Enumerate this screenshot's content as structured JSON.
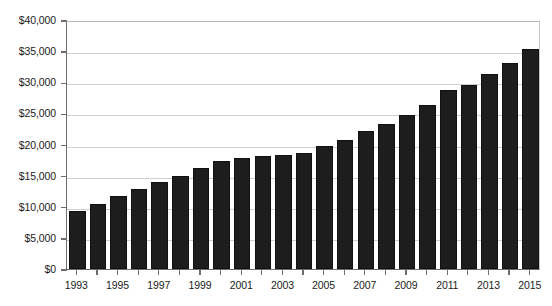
{
  "chart_data": {
    "type": "bar",
    "title": "",
    "subtitle": "",
    "xlabel": "",
    "ylabel": "",
    "grid": true,
    "legend": null,
    "legend_position": "none",
    "ylim": [
      0,
      40000
    ],
    "ytick_values": [
      0,
      5000,
      10000,
      15000,
      20000,
      25000,
      30000,
      35000,
      40000
    ],
    "ytick_labels": [
      "$0",
      "$5,000",
      "$10,000",
      "$15,000",
      "$20,000",
      "$25,000",
      "$30,000",
      "$35,000",
      "$40,000"
    ],
    "categories": [
      "1993",
      "1994",
      "1995",
      "1996",
      "1997",
      "1998",
      "1999",
      "2000",
      "2001",
      "2002",
      "2003",
      "2004",
      "2005",
      "2006",
      "2007",
      "2008",
      "2009",
      "2010",
      "2011",
      "2012",
      "2013",
      "2014",
      "2015"
    ],
    "xtick_labels_shown": [
      "1993",
      "1995",
      "1997",
      "1999",
      "2001",
      "2003",
      "2005",
      "2007",
      "2009",
      "2011",
      "2013",
      "2015"
    ],
    "values": [
      9400,
      10500,
      11800,
      12900,
      14000,
      14900,
      16300,
      17400,
      17800,
      18100,
      18300,
      18600,
      19800,
      20800,
      22100,
      23300,
      24800,
      26300,
      28800,
      29500,
      31300,
      33100,
      35300
    ],
    "series": [
      {
        "name": "Value",
        "color": "#1d1d1d",
        "values": [
          9400,
          10500,
          11800,
          12900,
          14000,
          14900,
          16300,
          17400,
          17800,
          18100,
          18300,
          18600,
          19800,
          20800,
          22100,
          23300,
          24800,
          26300,
          28800,
          29500,
          31300,
          33100,
          35300
        ]
      }
    ]
  },
  "style": {
    "bar_color": "#1d1d1d",
    "gridline_color": "#cfcfcf",
    "axis_color": "#6d6d6d",
    "text_color": "#1b1b1b",
    "background": "#ffffff"
  }
}
